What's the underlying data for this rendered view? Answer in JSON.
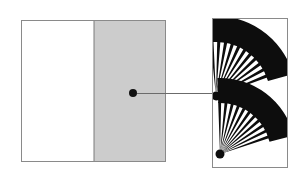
{
  "figure": {
    "title": "",
    "type": "detail-callout-diagram",
    "canvas": {
      "width": 303,
      "height": 181,
      "background": "#ffffff"
    },
    "colors": {
      "panel_border": "#8a8a8a",
      "panel_fill": "#ffffff",
      "shaded_region_fill": "#cccccc",
      "shaded_region_border": "#7a7a7a",
      "callout_dot": "#111111",
      "leader_line": "#6b6b6b",
      "detail_shape": "#0d0d0d",
      "detail_background": "#ffffff"
    },
    "overview_panel": {
      "name": "overview-panel",
      "x": 21,
      "y": 20,
      "width": 145,
      "height": 142,
      "fill": "#ffffff",
      "border_width": 1,
      "shaded_region": {
        "name": "shaded-region",
        "x": 94,
        "y": 20,
        "width": 72,
        "height": 142,
        "fill": "#cccccc"
      },
      "callout_point": {
        "name": "callout-dot",
        "cx": 133,
        "cy": 93,
        "r": 4
      }
    },
    "leader_line": {
      "name": "leader-line",
      "x1": 137,
      "y1": 93,
      "x2": 213,
      "y2": 93,
      "width": 1
    },
    "detail_panel": {
      "name": "detail-panel",
      "x": 212,
      "y": 18,
      "width": 76,
      "height": 150,
      "fill": "#ffffff",
      "border_width": 1,
      "shapes": [
        {
          "name": "fan-upper",
          "kind": "folding-fan",
          "pivot_x": 216,
          "pivot_y": 96,
          "inner_radius": 26,
          "outer_radius": 80,
          "start_angle_deg": -96,
          "end_angle_deg": -16,
          "rib_count": 11
        },
        {
          "name": "fan-lower",
          "kind": "folding-fan",
          "pivot_x": 220,
          "pivot_y": 154,
          "inner_radius": 24,
          "outer_radius": 76,
          "start_angle_deg": -92,
          "end_angle_deg": -14,
          "rib_count": 11
        }
      ]
    }
  }
}
